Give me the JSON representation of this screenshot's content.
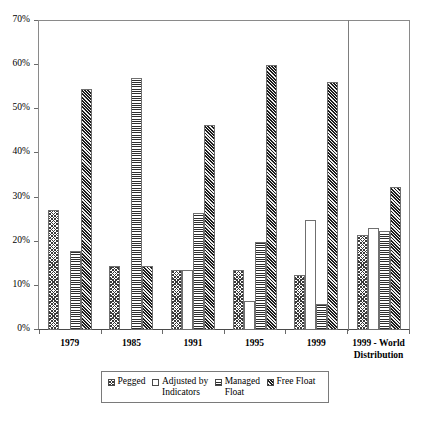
{
  "chart_data": {
    "type": "bar",
    "title": "",
    "xlabel": "",
    "ylabel": "",
    "ylim": [
      0,
      70
    ],
    "y_tick_labels": [
      "0%",
      "10%",
      "20%",
      "30%",
      "40%",
      "50%",
      "60%",
      "70%"
    ],
    "y_tick_values": [
      0,
      10,
      20,
      30,
      40,
      50,
      60,
      70
    ],
    "grid": false,
    "legend_position": "bottom",
    "categories": [
      "1979",
      "1985",
      "1991",
      "1995",
      "1999",
      "1999 - World\nDistribution"
    ],
    "series": [
      {
        "name": "Pegged",
        "pattern": "diagonal-crosshatch-light",
        "values": [
          27.2,
          14.5,
          13.5,
          13.5,
          12.5,
          21.5
        ]
      },
      {
        "name": "Adjusted by\nIndicators",
        "pattern": "solid-white",
        "values": [
          0.0,
          0.0,
          13.5,
          6.5,
          25.0,
          23.0
        ]
      },
      {
        "name": "Managed\nFloat",
        "pattern": "horizontal-lines",
        "values": [
          18.0,
          57.0,
          26.5,
          20.0,
          6.0,
          22.5
        ]
      },
      {
        "name": "Free Float",
        "pattern": "diagonal-hatch-dark",
        "values": [
          54.5,
          14.5,
          46.5,
          60.0,
          56.2,
          32.3
        ]
      }
    ],
    "separator_after_category_index": 4,
    "legend": [
      {
        "label": "Pegged",
        "swatch": "diagonal-crosshatch-light"
      },
      {
        "label": "Adjusted by\nIndicators",
        "swatch": "solid-white"
      },
      {
        "label": "Managed\nFloat",
        "swatch": "horizontal-lines"
      },
      {
        "label": "Free Float",
        "swatch": "diagonal-hatch-dark"
      }
    ]
  }
}
